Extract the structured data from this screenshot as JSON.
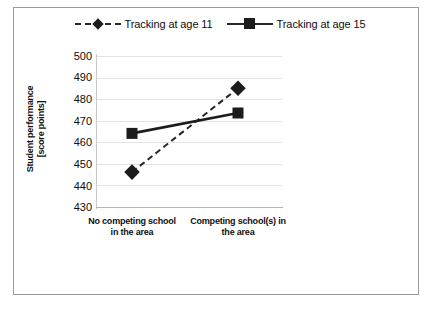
{
  "figure": {
    "background_color": "#ffffff",
    "frame_color": "#9a9a9a"
  },
  "legend": {
    "position": "top-center",
    "entries": [
      {
        "label": "Tracking at age 11",
        "marker": "diamond-marker",
        "line_style": "dashed",
        "color": "#1c1c1c"
      },
      {
        "label": "Tracking at age 15",
        "marker": "square-marker",
        "line_style": "solid",
        "color": "#1c1c1c"
      }
    ]
  },
  "axes": {
    "y_title_line1": "Student performance",
    "y_title_line2": "[score points]",
    "y_ticks": [
      "500",
      "490",
      "480",
      "470",
      "460",
      "450",
      "440",
      "430"
    ],
    "x_ticks": [
      "No competing school in the area",
      "Competing school(s) in the area"
    ]
  },
  "chart_data": {
    "type": "line",
    "title": "",
    "subtitle": "",
    "xlabel": "",
    "ylabel": "Student performance [score points]",
    "categories": [
      "No competing school in the area",
      "Competing school(s) in the area"
    ],
    "series": [
      {
        "name": "Tracking at age 11",
        "values": [
          446,
          485
        ],
        "line_style": "dashed",
        "marker": "diamond",
        "color": "#1c1c1c"
      },
      {
        "name": "Tracking at age 15",
        "values": [
          464,
          473.5
        ],
        "line_style": "solid",
        "marker": "square",
        "color": "#1c1c1c"
      }
    ],
    "ylim": [
      430,
      500
    ],
    "ytick_step": 10,
    "grid": true,
    "grid_axis": "y",
    "legend_position": "top"
  }
}
